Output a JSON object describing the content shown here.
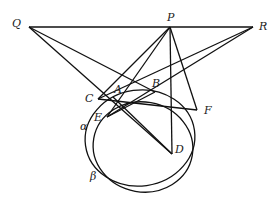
{
  "diagram": {
    "type": "geometry",
    "points": {
      "Q": {
        "label": "Q"
      },
      "P": {
        "label": "P"
      },
      "R": {
        "label": "R"
      },
      "A": {
        "label": "A"
      },
      "B": {
        "label": "B"
      },
      "C": {
        "label": "C"
      },
      "D": {
        "label": "D"
      },
      "E": {
        "label": "E"
      },
      "F": {
        "label": "F"
      }
    },
    "circles": [
      {
        "name": "alpha",
        "label": "α"
      },
      {
        "name": "beta",
        "label": "β"
      }
    ],
    "segments": [
      [
        "Q",
        "R"
      ],
      [
        "Q",
        "B"
      ],
      [
        "Q",
        "D"
      ],
      [
        "P",
        "C"
      ],
      [
        "P",
        "E"
      ],
      [
        "P",
        "D"
      ],
      [
        "P",
        "F"
      ],
      [
        "R",
        "C"
      ],
      [
        "R",
        "E"
      ],
      [
        "C",
        "F"
      ],
      [
        "A",
        "D"
      ],
      [
        "E",
        "B"
      ]
    ]
  }
}
